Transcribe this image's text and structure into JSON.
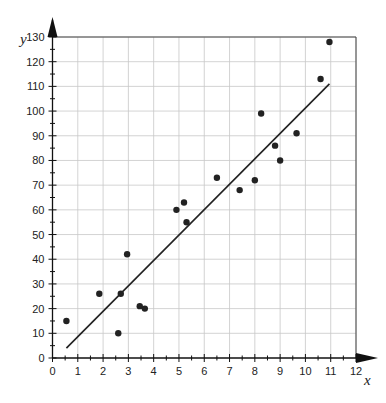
{
  "chart_data": {
    "type": "scatter",
    "title": "",
    "xlabel": "x",
    "ylabel": "y",
    "xlim": [
      0,
      12
    ],
    "ylim": [
      0,
      130
    ],
    "x_ticks": [
      "0",
      "1",
      "2",
      "3",
      "4",
      "5",
      "6",
      "7",
      "8",
      "9",
      "10",
      "11",
      "12"
    ],
    "y_ticks": [
      "0",
      "10",
      "20",
      "30",
      "40",
      "50",
      "60",
      "70",
      "80",
      "90",
      "100",
      "110",
      "120",
      "130"
    ],
    "grid": true,
    "points": [
      {
        "x": 0.55,
        "y": 15
      },
      {
        "x": 1.85,
        "y": 26
      },
      {
        "x": 2.6,
        "y": 10
      },
      {
        "x": 2.7,
        "y": 26
      },
      {
        "x": 2.95,
        "y": 42
      },
      {
        "x": 3.45,
        "y": 21
      },
      {
        "x": 3.65,
        "y": 20
      },
      {
        "x": 4.9,
        "y": 60
      },
      {
        "x": 5.2,
        "y": 63
      },
      {
        "x": 5.3,
        "y": 55
      },
      {
        "x": 6.5,
        "y": 73
      },
      {
        "x": 7.4,
        "y": 68
      },
      {
        "x": 8.0,
        "y": 72
      },
      {
        "x": 8.25,
        "y": 99
      },
      {
        "x": 8.8,
        "y": 86
      },
      {
        "x": 9.0,
        "y": 80
      },
      {
        "x": 9.65,
        "y": 91
      },
      {
        "x": 10.6,
        "y": 113
      },
      {
        "x": 10.95,
        "y": 128
      }
    ],
    "trend_line": {
      "x1": 0.55,
      "y1": 4,
      "x2": 10.95,
      "y2": 111
    }
  },
  "colors": {
    "axis": "#111111",
    "grid": "#c8c8c8",
    "point": "#222222",
    "line": "#222222"
  }
}
